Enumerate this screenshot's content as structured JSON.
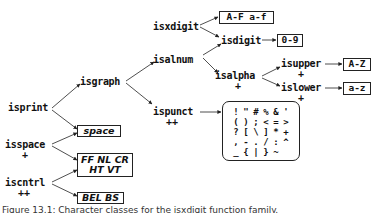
{
  "figure": {
    "nodes": {
      "isprint": {
        "label": "isprint",
        "marker": ""
      },
      "isgraph": {
        "label": "isgraph",
        "marker": ""
      },
      "isalnum": {
        "label": "isalnum",
        "marker": ""
      },
      "isxdigit": {
        "label": "isxdigit",
        "marker": ""
      },
      "isdigit": {
        "label": "isdigit",
        "marker": ""
      },
      "isalpha": {
        "label": "isalpha",
        "marker": "+"
      },
      "isupper": {
        "label": "isupper",
        "marker": "+"
      },
      "islower": {
        "label": "islower",
        "marker": "+"
      },
      "ispunct": {
        "label": "ispunct",
        "marker": "++"
      },
      "isspace": {
        "label": "isspace",
        "marker": "+"
      },
      "iscntrl": {
        "label": "iscntrl",
        "marker": "++"
      }
    },
    "boxes": {
      "xdigit_letters": "A-F a-f",
      "digits": "0-9",
      "upper": "A-Z",
      "lower": "a-z",
      "space": "space",
      "whitespace_line1": "FF NL CR",
      "whitespace_line2": "HT VT",
      "control": "BEL BS"
    },
    "punct_chars": [
      "!",
      "\"",
      "#",
      "%",
      "&",
      "'",
      "(",
      ")",
      ";",
      "<",
      "=",
      ">",
      "?",
      "[",
      "\\",
      "]",
      "*",
      "+",
      ",",
      "-",
      ".",
      "/",
      ":",
      "^",
      "_",
      "{",
      "|",
      "}",
      "~",
      ""
    ],
    "caption": "Figure 13.1: Character classes for the isxdigit function family."
  }
}
